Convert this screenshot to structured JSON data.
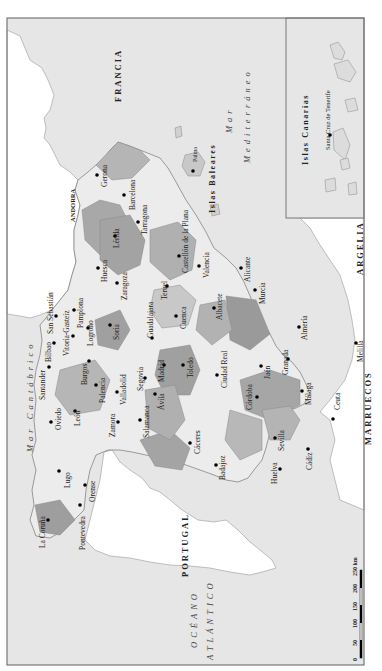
{
  "map": {
    "title": "Mapa de las provincias de España",
    "orientation": "rotated 90° counter-clockwise (north points left)",
    "colors": {
      "sea": "#e6e6e6",
      "foreign_land": "#ffffff",
      "province_light": "#ececec",
      "province_mid": "#c9c9c9",
      "province_dark": "#9e9e9e",
      "frame": "#777777",
      "city_dot": "#000000"
    },
    "countries": {
      "francia": "FRANCIA",
      "andorra": "ANDORRA",
      "portugal": "PORTUGAL",
      "argelia": "ARGELIA",
      "marruecos": "MARRUECOS"
    },
    "seas": {
      "cantabrico": "Mar Cantábrico",
      "mediterraneo_1": "Mar",
      "mediterraneo_2": "Mediterráneo",
      "atlantico_1": "OCÉANO",
      "atlantico_2": "ATLÁNTICO"
    },
    "islands": {
      "baleares": "Islas Baleares",
      "canarias": "Islas Canarias"
    },
    "cities": {
      "la_coruna": "La Coruña",
      "pontevedra": "Pontevedra",
      "lugo": "Lugo",
      "orense": "Orense",
      "oviedo": "Oviedo",
      "santander": "Santander",
      "bilbao": "Bilbao",
      "san_sebastian": "San Sebastián",
      "vitoria": "Vitoria-Gasteiz",
      "pamplona": "Pamplona",
      "logrono": "Logroño",
      "leon": "León",
      "palencia": "Palencia",
      "burgos": "Burgos",
      "soria": "Soria",
      "zamora": "Zamora",
      "valladolid": "Valladolid",
      "segovia": "Segovia",
      "salamanca": "Salamanca",
      "avila": "Ávila",
      "madrid": "Madrid",
      "guadalajara": "Guadalajara",
      "huesca": "Huesca",
      "zaragoza": "Zaragoza",
      "lerida": "Lérida",
      "gerona": "Gerona",
      "barcelona": "Barcelona",
      "tarragona": "Tarragona",
      "teruel": "Teruel",
      "castellon": "Castellón de la Plana",
      "cuenca": "Cuenca",
      "valencia": "Valencia",
      "toledo": "Toledo",
      "caceres": "Cáceres",
      "albacete": "Albacete",
      "alicante": "Alicante",
      "ciudad_real": "Ciudad Real",
      "badajoz": "Badajoz",
      "murcia": "Murcia",
      "jaen": "Jaén",
      "cordoba": "Córdoba",
      "almeria": "Almería",
      "granada": "Granada",
      "sevilla": "Sevilla",
      "malaga": "Málaga",
      "huelva": "Huelva",
      "cadiz": "Cádiz",
      "ceuta": "Ceuta",
      "melilla": "Melilla",
      "palma": "Palma",
      "santa_cruz": "Santa Cruz de Tenerife"
    },
    "scale": {
      "ticks": [
        "0",
        "50",
        "100",
        "150",
        "200",
        "250 km"
      ]
    }
  }
}
